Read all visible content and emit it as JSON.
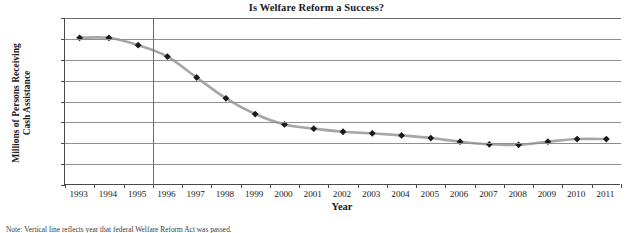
{
  "chart_data": {
    "type": "line",
    "title": "Is Welfare Reform a Success?",
    "xlabel": "Year",
    "ylabel_line1": "Millions of Persons Receiving",
    "ylabel_line2": "Cash Assistance",
    "categories": [
      1993,
      1994,
      1995,
      1996,
      1997,
      1998,
      1999,
      2000,
      2001,
      2002,
      2003,
      2004,
      2005,
      2006,
      2007,
      2008,
      2009,
      2010,
      2011
    ],
    "x_tick_labels": [
      "1993",
      "1994",
      "1995",
      "1996",
      "1997",
      "1998",
      "1999",
      "2000",
      "2001",
      "2002",
      "2003",
      "2004",
      "2005",
      "2006",
      "2007",
      "2008",
      "2009",
      "2010",
      "2011"
    ],
    "values": [
      14.1,
      14.1,
      13.4,
      12.3,
      10.3,
      8.3,
      6.8,
      5.8,
      5.4,
      5.1,
      4.95,
      4.75,
      4.5,
      4.15,
      3.9,
      3.85,
      4.15,
      4.4,
      4.4
    ],
    "series": [
      {
        "name": "Millions of Persons Receiving Cash Assistance",
        "values": [
          14.1,
          14.1,
          13.4,
          12.3,
          10.3,
          8.3,
          6.8,
          5.8,
          5.4,
          5.1,
          4.95,
          4.75,
          4.5,
          4.15,
          3.9,
          3.85,
          4.15,
          4.4,
          4.4
        ]
      }
    ],
    "ylim": [
      0,
      16
    ],
    "ytick_values": [
      0,
      2,
      4,
      6,
      8,
      10,
      12,
      14,
      16
    ],
    "y_tick_labels": [
      "0",
      "2",
      "4",
      "6",
      "8",
      "10",
      "12",
      "14",
      "16"
    ],
    "grid": true,
    "legend": false,
    "legend_position": "none",
    "annotations": [
      {
        "name": "welfare-reform-act-marker",
        "type": "vertical-line",
        "x": 1996
      }
    ],
    "marker_style": "diamond",
    "line_color": "#a6a6a6",
    "marker_color": "#1a1a1a",
    "grid_color": "#8f8f8f",
    "axis_color": "#4a4a4a"
  },
  "footnote": "Note: Vertical line reflects year that federal Welfare Reform Act was passed."
}
